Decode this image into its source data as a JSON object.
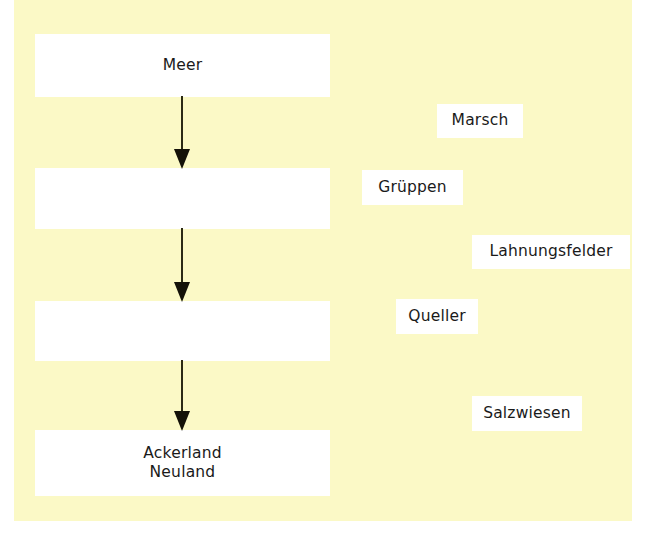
{
  "diagram": {
    "background_color": "#ffffff",
    "panel_color": "#fbf9c6",
    "box_color": "#ffffff",
    "arrow_color": "#2b2a14",
    "text_color": "#1a1a1a",
    "chain": [
      {
        "id": "meer",
        "label": "Meer"
      },
      {
        "id": "stage-2",
        "label": ""
      },
      {
        "id": "stage-3",
        "label": ""
      },
      {
        "id": "ackerland",
        "label": "Ackerland\nNeuland"
      }
    ],
    "arrows": [
      {
        "id": "arrow-1",
        "direction": "down"
      },
      {
        "id": "arrow-2",
        "direction": "down"
      },
      {
        "id": "arrow-3",
        "direction": "down"
      }
    ],
    "annotations": [
      {
        "id": "marsch",
        "label": "Marsch"
      },
      {
        "id": "grueppen",
        "label": "Grüppen"
      },
      {
        "id": "lahnungsfelder",
        "label": "Lahnungsfelder"
      },
      {
        "id": "queller",
        "label": "Queller"
      },
      {
        "id": "salzwiesen",
        "label": "Salzwiesen"
      }
    ]
  }
}
